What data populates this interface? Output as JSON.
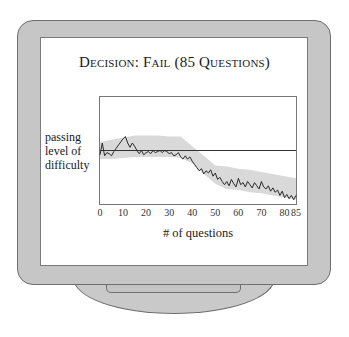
{
  "chart_data": {
    "type": "line",
    "title": "Decision: Fail (85 Questions)",
    "xlabel": "# of questions",
    "ylabel": "passing level of difficulty",
    "xlim": [
      0,
      85
    ],
    "x_ticks": [
      "0",
      "10",
      "20",
      "30",
      "40",
      "50",
      "60",
      "70",
      "80",
      "85"
    ],
    "x_tick_values": [
      0,
      10,
      20,
      30,
      40,
      50,
      60,
      70,
      80,
      85
    ],
    "grid": false,
    "legend": null,
    "passing_level": 0.5,
    "ylim": [
      0,
      1
    ],
    "series": [
      {
        "name": "ability estimate",
        "x": [
          0,
          1,
          2,
          3,
          4,
          5,
          6,
          7,
          8,
          9,
          10,
          11,
          12,
          13,
          14,
          15,
          16,
          17,
          18,
          19,
          20,
          21,
          22,
          23,
          24,
          25,
          26,
          27,
          28,
          29,
          30,
          31,
          32,
          33,
          34,
          35,
          36,
          37,
          38,
          39,
          40,
          41,
          42,
          43,
          44,
          45,
          46,
          47,
          48,
          49,
          50,
          51,
          52,
          53,
          54,
          55,
          56,
          57,
          58,
          59,
          60,
          61,
          62,
          63,
          64,
          65,
          66,
          67,
          68,
          69,
          70,
          71,
          72,
          73,
          74,
          75,
          76,
          77,
          78,
          79,
          80,
          81,
          82,
          83,
          84,
          85
        ],
        "y": [
          0.46,
          0.57,
          0.45,
          0.48,
          0.47,
          0.45,
          0.49,
          0.52,
          0.55,
          0.58,
          0.61,
          0.63,
          0.57,
          0.53,
          0.57,
          0.54,
          0.5,
          0.47,
          0.5,
          0.46,
          0.48,
          0.49,
          0.47,
          0.5,
          0.48,
          0.49,
          0.5,
          0.48,
          0.5,
          0.49,
          0.47,
          0.48,
          0.45,
          0.46,
          0.48,
          0.44,
          0.42,
          0.45,
          0.42,
          0.44,
          0.4,
          0.37,
          0.34,
          0.31,
          0.33,
          0.28,
          0.31,
          0.29,
          0.32,
          0.26,
          0.29,
          0.23,
          0.25,
          0.21,
          0.18,
          0.21,
          0.17,
          0.23,
          0.19,
          0.16,
          0.24,
          0.18,
          0.2,
          0.16,
          0.21,
          0.18,
          0.15,
          0.2,
          0.17,
          0.14,
          0.21,
          0.16,
          0.14,
          0.17,
          0.12,
          0.15,
          0.11,
          0.13,
          0.08,
          0.12,
          0.06,
          0.09,
          0.05,
          0.08,
          0.04,
          0.08
        ]
      }
    ],
    "confidence_band": {
      "x": [
        0,
        5,
        10,
        15,
        20,
        25,
        30,
        35,
        40,
        45,
        50,
        55,
        60,
        65,
        70,
        75,
        80,
        85
      ],
      "upper": [
        0.58,
        0.6,
        0.62,
        0.64,
        0.64,
        0.64,
        0.63,
        0.63,
        0.54,
        0.45,
        0.36,
        0.35,
        0.33,
        0.32,
        0.3,
        0.28,
        0.26,
        0.24
      ],
      "lower": [
        0.42,
        0.42,
        0.43,
        0.44,
        0.44,
        0.44,
        0.44,
        0.43,
        0.38,
        0.28,
        0.19,
        0.14,
        0.13,
        0.11,
        0.1,
        0.08,
        0.06,
        0.04
      ]
    }
  },
  "screen": {
    "title": "Decision: Fail (85 Questions)",
    "ylabel_lines": [
      "passing",
      "level of",
      "difficulty"
    ],
    "xlabel": "# of questions"
  },
  "colors": {
    "frame": "#c6c6c6",
    "frame_border": "#6e6e6e",
    "band": "#d9d9d9",
    "line": "#2a2a2a",
    "passing_line": "#333333"
  }
}
